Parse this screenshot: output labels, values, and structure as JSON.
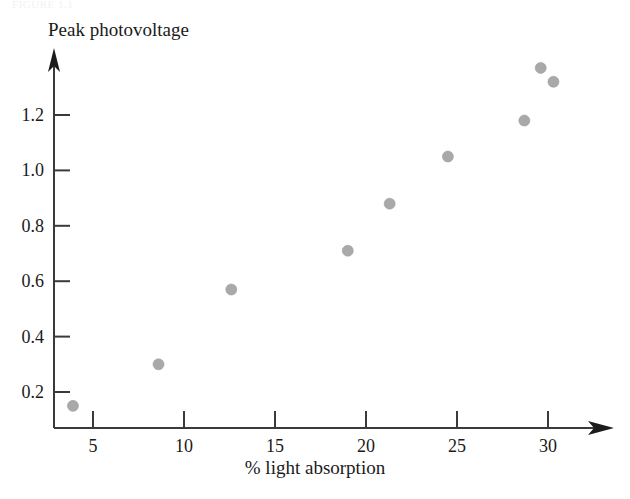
{
  "figure": {
    "ghost_caption": "FIGURE 1.1",
    "background_color": "#ffffff"
  },
  "chart_data": {
    "type": "scatter",
    "title": "",
    "xlabel": "% light absorption",
    "ylabel": "Peak photovoltage",
    "x": [
      3.9,
      8.6,
      12.6,
      19.0,
      21.3,
      24.5,
      28.7,
      29.6,
      30.3
    ],
    "y": [
      0.15,
      0.3,
      0.57,
      0.71,
      0.88,
      1.05,
      1.18,
      1.37,
      1.32
    ],
    "points": [
      {
        "x": 3.9,
        "y": 0.15
      },
      {
        "x": 8.6,
        "y": 0.3
      },
      {
        "x": 12.6,
        "y": 0.57
      },
      {
        "x": 19.0,
        "y": 0.71
      },
      {
        "x": 21.3,
        "y": 0.88
      },
      {
        "x": 24.5,
        "y": 1.05
      },
      {
        "x": 28.7,
        "y": 1.18
      },
      {
        "x": 29.6,
        "y": 1.37
      },
      {
        "x": 30.3,
        "y": 1.32
      }
    ],
    "xlim": [
      2.0,
      33.5
    ],
    "ylim": [
      0.0,
      1.54
    ],
    "xticks": [
      5,
      10,
      15,
      20,
      25,
      30
    ],
    "xtick_labels": [
      "5",
      "10",
      "15",
      "20",
      "25",
      "30"
    ],
    "yticks": [
      0.2,
      0.4,
      0.6,
      0.8,
      1.0,
      1.2
    ],
    "ytick_labels": [
      "0.2",
      "0.4",
      "0.6",
      "0.8",
      "1.0",
      "1.2"
    ],
    "grid": false,
    "legend": null,
    "marker_color": "#a9a9a9",
    "axis_color": "#3a3a3a",
    "marker_shape": "circle",
    "marker_size_px": 11,
    "axis_arrows": [
      "x-right",
      "y-up"
    ]
  }
}
